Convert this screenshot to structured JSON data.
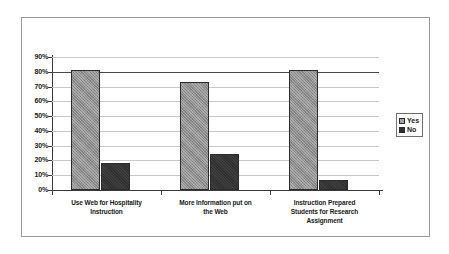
{
  "chart_data": {
    "type": "bar",
    "title": "",
    "subtitle": "",
    "xlabel": "",
    "ylabel": "",
    "ylim": [
      0,
      90
    ],
    "grid": true,
    "legend_position": "right",
    "categories": [
      "Use Web for Hospitality Instruction",
      "More Information put on the Web",
      "Instruction Prepared Students for Research Assignment"
    ],
    "category_lines": [
      [
        "Use Web for Hospitality",
        "Instruction"
      ],
      [
        "More Information put on",
        "the Web"
      ],
      [
        "Instruction Prepared",
        "Students for Research",
        "Assignment"
      ]
    ],
    "ytick_labels": [
      "0%",
      "10%",
      "20%",
      "30%",
      "40%",
      "50%",
      "60%",
      "70%",
      "80%",
      "90%"
    ],
    "ytick_values": [
      0,
      10,
      20,
      30,
      40,
      50,
      60,
      70,
      80,
      90
    ],
    "series": [
      {
        "name": "Yes",
        "values": [
          81,
          73,
          81.5
        ],
        "color": "#8d8d8d"
      },
      {
        "name": "No",
        "values": [
          18,
          24.5,
          7
        ],
        "color": "#2f2f2f"
      }
    ]
  },
  "legend": {
    "entries": [
      {
        "label": "Yes",
        "swatch": "legend-swatch-yes"
      },
      {
        "label": "No",
        "swatch": "legend-swatch-no"
      }
    ]
  },
  "colors": {
    "series_yes": "#8d8d8d",
    "series_no": "#2f2f2f",
    "frame_border": "#9a9a9a",
    "gridline": "#c9c9c9",
    "axis": "#3a3a3a",
    "background": "#ffffff"
  }
}
